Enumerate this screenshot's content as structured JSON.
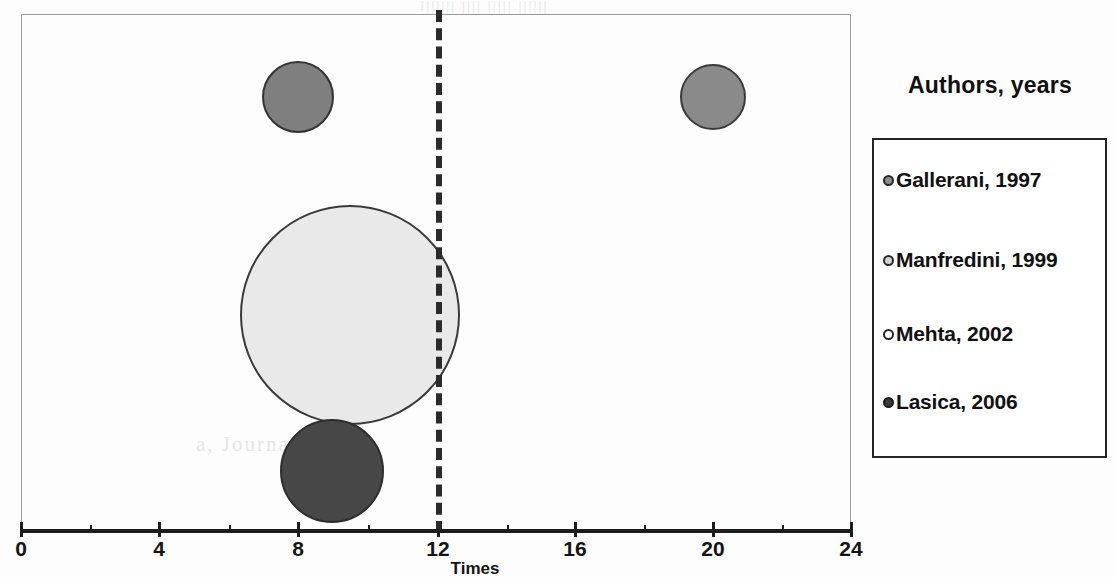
{
  "chart_data": {
    "type": "scatter",
    "title": "",
    "xlabel": "Times",
    "ylabel": "",
    "xlim": [
      0,
      24
    ],
    "xticks": [
      0,
      4,
      8,
      12,
      16,
      20,
      24
    ],
    "xtick_labels": [
      "0",
      "4",
      "8",
      "12",
      "16",
      "20",
      "24"
    ],
    "minor_tick_step": 2,
    "grid": false,
    "legend_position": "right",
    "annotations": [
      {
        "name": "threshold-line",
        "type": "vertical-dashed-line",
        "x": 12
      }
    ],
    "series": [
      {
        "name": "Gallerani, 1997",
        "x": 8,
        "y_px": 97,
        "radius_px": 36,
        "fill": "#7f7f7f",
        "stroke": "#333333"
      },
      {
        "name": "Manfredini, 1999",
        "x": 20,
        "y_px": 97,
        "radius_px": 33,
        "fill": "#8a8a8a",
        "stroke": "#3a3a3a"
      },
      {
        "name": "Mehta, 2002",
        "x": 9.5,
        "y_px": 315,
        "radius_px": 110,
        "fill": "#e9e9e9",
        "stroke": "#3a3a3a"
      },
      {
        "name": "Lasica, 2006",
        "x": 9,
        "y_px": 471,
        "radius_px": 52,
        "fill": "#474747",
        "stroke": "#2e2e2e"
      }
    ]
  },
  "axis": {
    "title": "Times",
    "ticks": [
      {
        "label": "0",
        "left_px": 21
      },
      {
        "label": "4",
        "left_px": 159
      },
      {
        "label": "8",
        "left_px": 298
      },
      {
        "label": "12",
        "left_px": 438
      },
      {
        "label": "16",
        "left_px": 575
      },
      {
        "label": "20",
        "left_px": 713
      },
      {
        "label": "24",
        "left_px": 851
      }
    ]
  },
  "legend": {
    "title": "Authors, years",
    "items": [
      {
        "label": "Gallerani, 1997",
        "marker_fill": "#8c8c8c",
        "marker_stroke": "#2a2a2a",
        "top_px": 28
      },
      {
        "label": "Manfredini, 1999",
        "marker_fill": "#d2d2d2",
        "marker_stroke": "#2a2a2a",
        "top_px": 108
      },
      {
        "label": "Mehta, 2002",
        "marker_fill": "#ffffff",
        "marker_stroke": "#2a2a2a",
        "top_px": 182
      },
      {
        "label": "Lasica, 2006",
        "marker_fill": "#3b3b3b",
        "marker_stroke": "#1a1a1a",
        "top_px": 250
      }
    ]
  },
  "ghost_text": {
    "top_band": "l||||||   ||||   |||||  ||||||",
    "mid_left": "No 11 - 0",
    "mid_low": "a, Journal"
  }
}
